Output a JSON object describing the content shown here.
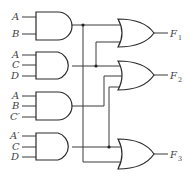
{
  "diagram": {
    "type": "logic-circuit",
    "and_gates": [
      {
        "id": "and1",
        "inputs": [
          "A",
          "B"
        ]
      },
      {
        "id": "and2",
        "inputs": [
          "A",
          "C",
          "D"
        ]
      },
      {
        "id": "and3",
        "inputs": [
          "A",
          "B",
          "C′"
        ]
      },
      {
        "id": "and4",
        "inputs": [
          "A′",
          "C",
          "D"
        ]
      }
    ],
    "or_gates": [
      {
        "id": "or1",
        "output": "F",
        "sub": "1",
        "inputs_from": [
          "and1",
          "and2"
        ]
      },
      {
        "id": "or2",
        "output": "F",
        "sub": "2",
        "inputs_from": [
          "and2",
          "and3",
          "and4"
        ]
      },
      {
        "id": "or3",
        "output": "F",
        "sub": "3",
        "inputs_from": [
          "and4",
          "and1"
        ]
      }
    ],
    "colors": {
      "line": "#2a2a2a",
      "text": "#444444",
      "background": "#ffffff"
    }
  }
}
